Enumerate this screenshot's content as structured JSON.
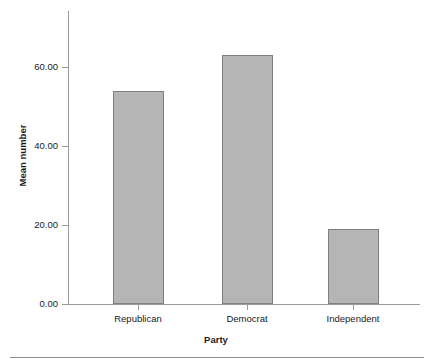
{
  "chart_data": {
    "type": "bar",
    "title": "",
    "xlabel": "Party",
    "ylabel": "Mean number",
    "categories": [
      "Republican",
      "Democrat",
      "Independent"
    ],
    "values": [
      54,
      63,
      19
    ],
    "ylim": [
      0,
      70
    ],
    "ytick_values": [
      0,
      20,
      40,
      60
    ],
    "ytick_labels": [
      "0.00",
      "20.00",
      "40.00",
      "60.00"
    ],
    "grid": false,
    "legend": null,
    "colors": {
      "bar_fill": "#b5b5b5",
      "bar_border": "#7f7f7f",
      "axis": "#9a9a9a",
      "text": "#1a1a1a",
      "background": "#ffffff"
    }
  },
  "axes": {
    "y_title": "Mean number",
    "x_title": "Party",
    "y_labels": {
      "t0": "0.00",
      "t1": "20.00",
      "t2": "40.00",
      "t3": "60.00"
    },
    "x_labels": {
      "c0": "Republican",
      "c1": "Democrat",
      "c2": "Independent"
    }
  }
}
